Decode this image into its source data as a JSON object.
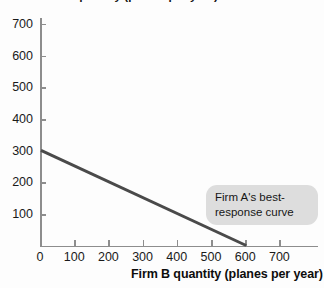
{
  "chart_data": {
    "type": "line",
    "title": "",
    "xlabel": "Firm B quantity (planes per year)",
    "ylabel": "Firm A quantity (planes per year)",
    "xlim": [
      0,
      730
    ],
    "ylim": [
      0,
      740
    ],
    "xticks": [
      0,
      100,
      200,
      300,
      400,
      500,
      600,
      700
    ],
    "xticklabels": [
      "0",
      "100",
      "200",
      "300",
      "400",
      "500",
      "600",
      "700"
    ],
    "yticks": [
      100,
      200,
      300,
      400,
      500,
      600,
      700
    ],
    "yticklabels": [
      "100",
      "200",
      "300",
      "400",
      "500",
      "600",
      "700"
    ],
    "grid": false,
    "legend": null,
    "series": [
      {
        "name": "Firm A's best-response curve",
        "color": "#4a4a4a",
        "linewidth": 3,
        "x": [
          0,
          600
        ],
        "y": [
          300,
          0
        ]
      }
    ],
    "annotations": [
      {
        "name": "best-response-callout",
        "lines": [
          "Firm A's best-",
          "response curve"
        ],
        "x": 500,
        "y": 185,
        "background": "#dddddd"
      }
    ]
  },
  "axes": {
    "y_title": "Firm A quantity (planes per year)",
    "x_title": "Firm B quantity (planes per year)",
    "axis_color": "#8d8d8d",
    "tick_label_color": "#1a1a1a"
  },
  "callout": {
    "line1": "Firm A's best-",
    "line2": "response curve"
  }
}
